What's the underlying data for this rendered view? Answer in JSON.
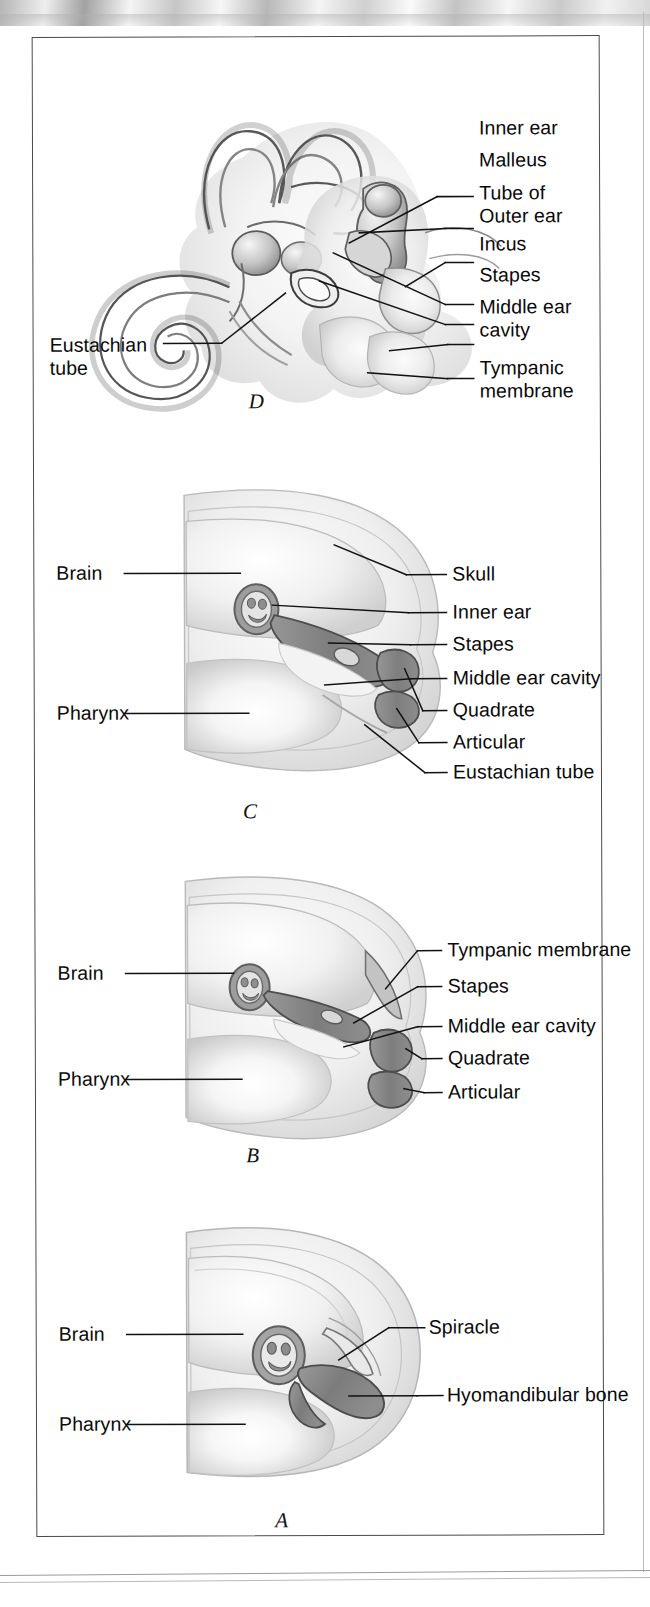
{
  "figure": {
    "caption_letters": [
      "A",
      "B",
      "C",
      "D"
    ],
    "panels": [
      {
        "id": "D",
        "letter": "D",
        "description": "Mammal ear with three ossicles, cochlea and semicircular canals",
        "labels_right": [
          "Inner ear",
          "Malleus",
          "Tube of\nOuter ear",
          "Incus",
          "Stapes",
          "Middle ear\ncavity",
          "Tympanic\nmembrane"
        ],
        "labels_left": [
          "Eustachian\ntube"
        ]
      },
      {
        "id": "C",
        "letter": "C",
        "description": "Mammal-like reptile / early mammal jaw and ear",
        "labels_right": [
          "Skull",
          "Inner ear",
          "Stapes",
          "Middle ear cavity",
          "Quadrate",
          "Articular",
          "Eustachian tube"
        ],
        "labels_left": [
          "Brain",
          "Pharynx"
        ]
      },
      {
        "id": "B",
        "letter": "B",
        "description": "Early tetrapod / reptile ear with tympanic membrane and stapes",
        "labels_right": [
          "Tympanic membrane",
          "Stapes",
          "Middle ear cavity",
          "Quadrate",
          "Articular"
        ],
        "labels_left": [
          "Brain",
          "Pharynx"
        ]
      },
      {
        "id": "A",
        "letter": "A",
        "description": "Fish head showing spiracle and hyomandibular bone",
        "labels_right": [
          "Spiracle",
          "Hyomandibular bone"
        ],
        "labels_left": [
          "Brain",
          "Pharynx"
        ]
      }
    ],
    "colors": {
      "frame": "#4a4a4a",
      "text": "#0a0a0a",
      "leader_line": "#111111",
      "bone_dark": "#8a8a8a",
      "tissue_light": "#e8e8e8",
      "tissue_mid": "#cfcfcf",
      "background": "#ffffff"
    }
  }
}
